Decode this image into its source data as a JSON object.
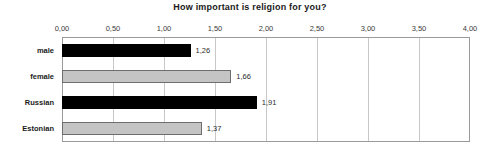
{
  "chart_data": {
    "type": "bar",
    "orientation": "horizontal",
    "title": "How important is religion for you?",
    "xlabel": "",
    "ylabel": "",
    "categories": [
      "male",
      "female",
      "Russian",
      "Estonian"
    ],
    "values": [
      1.26,
      1.66,
      1.91,
      1.37
    ],
    "value_labels": [
      "1,26",
      "1,66",
      "1,91",
      "1,37"
    ],
    "bar_colors": [
      "#000000",
      "#c4c4c4",
      "#000000",
      "#c4c4c4"
    ],
    "xlim": [
      0.0,
      4.0
    ],
    "xticks": [
      0.0,
      0.5,
      1.0,
      1.5,
      2.0,
      2.5,
      3.0,
      3.5,
      4.0
    ],
    "xtick_labels": [
      "0,00",
      "0,50",
      "1,00",
      "1,50",
      "2,00",
      "2,50",
      "3,00",
      "3,50",
      "4,00"
    ],
    "grid": true,
    "grid_axis": "x",
    "legend": false,
    "decimal_separator": ","
  },
  "colors": {
    "bar_dark": "#000000",
    "bar_light": "#c4c4c4",
    "bar_light_border": "#6e6e6e",
    "gridline": "#c8c8c8",
    "plot_border": "#9a9a9a",
    "text": "#1a1a1a",
    "background": "#ffffff"
  }
}
